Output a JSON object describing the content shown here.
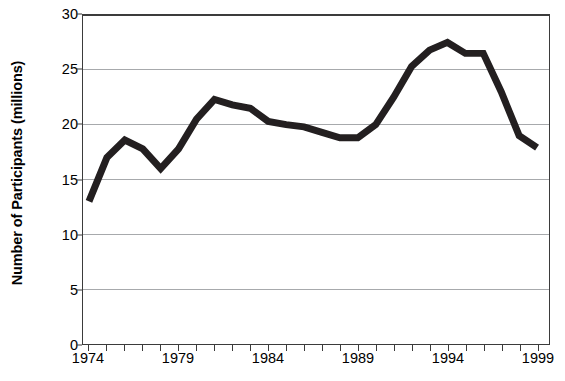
{
  "chart_data": {
    "type": "line",
    "title": "",
    "xlabel": "",
    "ylabel": "Number of Participants (millions)",
    "x": [
      1974,
      1975,
      1976,
      1977,
      1978,
      1979,
      1980,
      1981,
      1982,
      1983,
      1984,
      1985,
      1986,
      1987,
      1988,
      1989,
      1990,
      1991,
      1992,
      1993,
      1994,
      1995,
      1996,
      1997,
      1998,
      1999
    ],
    "values": [
      13.0,
      17.0,
      18.6,
      17.8,
      16.0,
      17.8,
      20.5,
      22.3,
      21.8,
      21.5,
      20.3,
      20.0,
      19.8,
      19.3,
      18.8,
      18.8,
      20.0,
      22.5,
      25.3,
      26.8,
      27.5,
      26.5,
      26.5,
      23.0,
      19.0,
      17.9
    ],
    "series": [
      {
        "name": "Number of Participants",
        "values": [
          13.0,
          17.0,
          18.6,
          17.8,
          16.0,
          17.8,
          20.5,
          22.3,
          21.8,
          21.5,
          20.3,
          20.0,
          19.8,
          19.3,
          18.8,
          18.8,
          20.0,
          22.5,
          25.3,
          26.8,
          27.5,
          26.5,
          26.5,
          23.0,
          19.0,
          17.9
        ],
        "color": "#231f20"
      }
    ],
    "xlim": [
      1974,
      1999
    ],
    "ylim": [
      0,
      30
    ],
    "y_ticks": [
      0,
      5,
      10,
      15,
      20,
      25,
      30
    ],
    "y_tick_labels": [
      "0",
      "5",
      "10",
      "15",
      "20",
      "25",
      "30"
    ],
    "x_ticks": [
      1974,
      1975,
      1976,
      1977,
      1978,
      1979,
      1980,
      1981,
      1982,
      1983,
      1984,
      1985,
      1986,
      1987,
      1988,
      1989,
      1990,
      1991,
      1992,
      1993,
      1994,
      1995,
      1996,
      1997,
      1998,
      1999
    ],
    "x_tick_labels_shown": [
      "1974",
      "1979",
      "1984",
      "1989",
      "1994",
      "1999"
    ],
    "x_tick_label_years": [
      1974,
      1979,
      1984,
      1989,
      1994,
      1999
    ],
    "grid": "horizontal",
    "legend": "none",
    "line_color": "#231f20",
    "line_width": 7,
    "grid_color": "#a7a9ac",
    "axis_color": "#3b3b3b",
    "background": "#ffffff"
  }
}
